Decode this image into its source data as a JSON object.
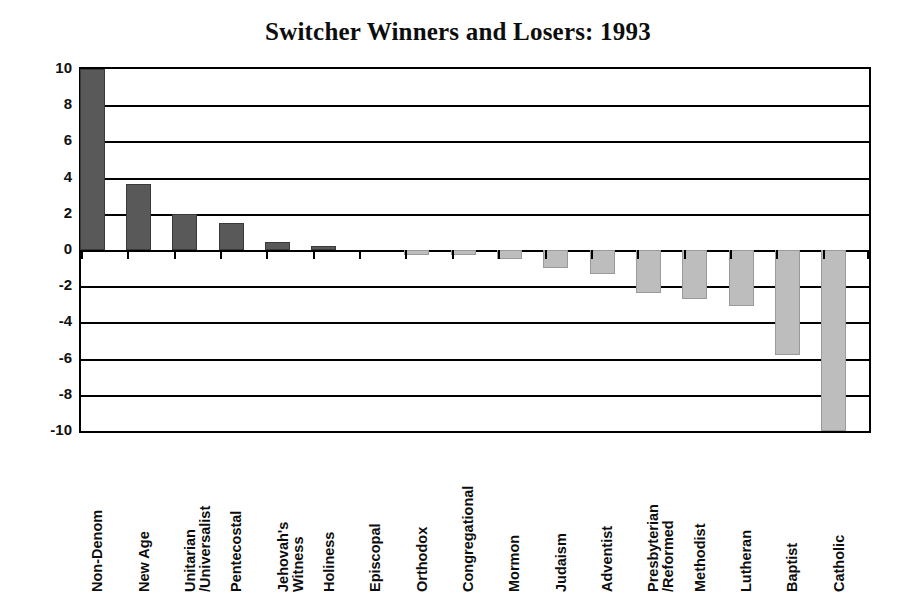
{
  "chart_data": {
    "type": "bar",
    "title": "Switcher Winners and Losers: 1993",
    "xlabel": "",
    "ylabel": "",
    "ylim": [
      -10,
      10
    ],
    "yticks": [
      10,
      8,
      6,
      4,
      2,
      0,
      -2,
      -4,
      -6,
      -8,
      -10
    ],
    "ytick_labels": [
      "10",
      "8",
      "6",
      "4",
      "2",
      "0",
      "-2",
      "-4",
      "-6",
      "-8",
      "-10"
    ],
    "grid": true,
    "grid_axis": "y",
    "legend": "none",
    "orientation": "vertical",
    "categories": [
      "Non-Denom",
      "New Age",
      "Unitarian /Universalist",
      "Pentecostal",
      "Jehovah's Witness",
      "Holiness",
      "Episcopal",
      "Orthodox",
      "Congregational",
      "Mormon",
      "Judaism",
      "Adventist",
      "Presbyterian /Reformed",
      "Methodist",
      "Lutheran",
      "Baptist",
      "Catholic"
    ],
    "category_label_lines": [
      [
        "Non-Denom"
      ],
      [
        "New Age"
      ],
      [
        "Unitarian",
        "/Universalist"
      ],
      [
        "Pentecostal"
      ],
      [
        "Jehovah's",
        "Witness"
      ],
      [
        "Holiness"
      ],
      [
        "Episcopal"
      ],
      [
        "Orthodox"
      ],
      [
        "Congregational"
      ],
      [
        "Mormon"
      ],
      [
        "Judaism"
      ],
      [
        "Adventist"
      ],
      [
        "Presbyterian",
        "/Reformed"
      ],
      [
        "Methodist"
      ],
      [
        "Lutheran"
      ],
      [
        "Baptist"
      ],
      [
        "Catholic"
      ]
    ],
    "values": [
      10.1,
      3.65,
      2.0,
      1.5,
      0.45,
      0.2,
      0.0,
      -0.3,
      -0.3,
      -0.5,
      -1.0,
      -1.3,
      -2.4,
      -2.7,
      -3.1,
      -5.8,
      -10.3
    ],
    "colors": {
      "positive_bar": "#595959",
      "negative_bar": "#bdbdbd",
      "axis": "#000000",
      "background": "#ffffff",
      "text": "#0d0d0d"
    }
  }
}
